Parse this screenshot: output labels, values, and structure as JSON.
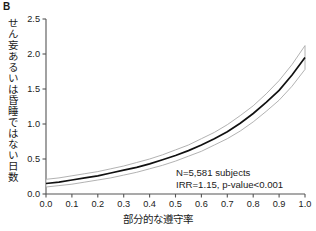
{
  "panel": {
    "label": "B"
  },
  "chart_data": {
    "type": "line",
    "title": "",
    "subtitle": "",
    "xlabel": "部分的な遵守率",
    "ylabel": "せん妄あるいは昏睡ではない日数",
    "xlim": [
      0.0,
      1.0
    ],
    "ylim": [
      0.0,
      2.5
    ],
    "xticks": [
      "0.0",
      "0.1",
      "0.2",
      "0.3",
      "0.4",
      "0.5",
      "0.6",
      "0.7",
      "0.8",
      "0.9",
      "1.0"
    ],
    "xtick_values": [
      0.0,
      0.1,
      0.2,
      0.3,
      0.4,
      0.5,
      0.6,
      0.7,
      0.8,
      0.9,
      1.0
    ],
    "yticks": [
      "0.0",
      "0.5",
      "1.0",
      "1.5",
      "2.0",
      "2.5"
    ],
    "ytick_values": [
      0.0,
      0.5,
      1.0,
      1.5,
      2.0,
      2.5
    ],
    "grid": false,
    "legend": "none",
    "line_color": "#111111",
    "band_color": "#b8b8b8",
    "series": [
      {
        "name": "estimate",
        "x": [
          0.0,
          0.05,
          0.1,
          0.15,
          0.2,
          0.25,
          0.3,
          0.35,
          0.4,
          0.45,
          0.5,
          0.55,
          0.6,
          0.65,
          0.7,
          0.75,
          0.8,
          0.85,
          0.9,
          0.95,
          1.0
        ],
        "values": [
          0.15,
          0.17,
          0.2,
          0.23,
          0.26,
          0.3,
          0.34,
          0.38,
          0.43,
          0.49,
          0.55,
          0.62,
          0.7,
          0.79,
          0.89,
          1.01,
          1.15,
          1.31,
          1.48,
          1.7,
          1.95
        ]
      },
      {
        "name": "ci_upper",
        "x": [
          0.0,
          0.05,
          0.1,
          0.15,
          0.2,
          0.25,
          0.3,
          0.35,
          0.4,
          0.45,
          0.5,
          0.55,
          0.6,
          0.65,
          0.7,
          0.75,
          0.8,
          0.85,
          0.9,
          0.95,
          1.0
        ],
        "values": [
          0.21,
          0.23,
          0.26,
          0.29,
          0.32,
          0.36,
          0.4,
          0.45,
          0.5,
          0.56,
          0.63,
          0.7,
          0.79,
          0.88,
          0.99,
          1.12,
          1.26,
          1.43,
          1.62,
          1.85,
          2.12
        ]
      },
      {
        "name": "ci_lower",
        "x": [
          0.0,
          0.05,
          0.1,
          0.15,
          0.2,
          0.25,
          0.3,
          0.35,
          0.4,
          0.45,
          0.5,
          0.55,
          0.6,
          0.65,
          0.7,
          0.75,
          0.8,
          0.85,
          0.9,
          0.95,
          1.0
        ],
        "values": [
          0.1,
          0.12,
          0.14,
          0.17,
          0.2,
          0.23,
          0.27,
          0.31,
          0.36,
          0.41,
          0.47,
          0.54,
          0.61,
          0.7,
          0.79,
          0.9,
          1.03,
          1.18,
          1.34,
          1.54,
          1.78
        ]
      }
    ],
    "annotations": [
      {
        "text": "N=5,581 subjects"
      },
      {
        "text": "IRR=1.15, p-value<0.001"
      }
    ]
  }
}
